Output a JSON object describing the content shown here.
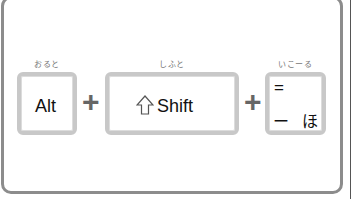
{
  "shortcut": {
    "keys": [
      {
        "label": "おると",
        "text": "Alt"
      },
      {
        "label": "しふと",
        "text": "Shift",
        "icon": "shift-arrow-icon"
      },
      {
        "label": "いこーる",
        "top": "=",
        "bottom_left": "ー",
        "bottom_right": "ほ"
      }
    ],
    "separators": [
      "+",
      "+"
    ]
  },
  "colors": {
    "frame": "#8c8c8c",
    "key_border": "#c8c8c8",
    "plus": "#666666",
    "text": "#111111"
  }
}
